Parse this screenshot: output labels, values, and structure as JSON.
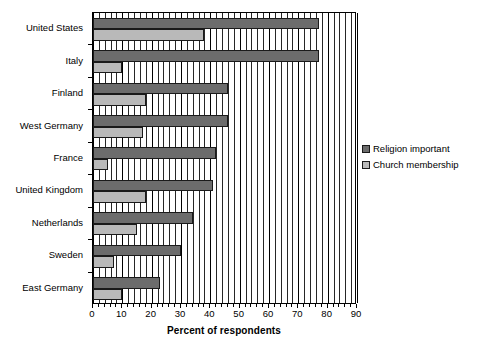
{
  "chart_data": {
    "type": "bar",
    "orientation": "horizontal",
    "title": "",
    "xlabel": "Percent of respondents",
    "ylabel": "",
    "xlim": [
      0,
      90
    ],
    "xticks": [
      0,
      10,
      20,
      30,
      40,
      50,
      60,
      70,
      80,
      90
    ],
    "xtick_labels": [
      "0",
      "10",
      "20",
      "30",
      "40",
      "50",
      "60",
      "70",
      "80",
      "90"
    ],
    "grid": true,
    "grid_axis": "x",
    "grid_minor_step": 2,
    "legend_position": "right",
    "categories": [
      "United States",
      "Italy",
      "Finland",
      "West Germany",
      "France",
      "United Kingdom",
      "Netherlands",
      "Sweden",
      "East Germany"
    ],
    "series": [
      {
        "name": "Religion important",
        "color": "#6c6c6c",
        "values": [
          77,
          77,
          46,
          46,
          42,
          41,
          34,
          30,
          23
        ]
      },
      {
        "name": "Church membership",
        "color": "#b9b9b9",
        "values": [
          38,
          10,
          18,
          17,
          5,
          18,
          15,
          7,
          10
        ]
      }
    ]
  },
  "legend": {
    "items": [
      {
        "label": "Religion important"
      },
      {
        "label": "Church membership"
      }
    ]
  },
  "colors": {
    "series_religion_important": "#6c6c6c",
    "series_church_membership": "#b9b9b9",
    "axis": "#000000",
    "background": "#ffffff"
  }
}
